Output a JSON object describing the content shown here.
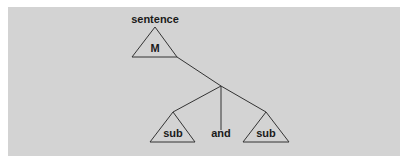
{
  "diagram": {
    "type": "tree",
    "root_label": "sentence",
    "root_node": "M",
    "children": [
      {
        "label": "sub",
        "kind": "subtree"
      },
      {
        "label": "and",
        "kind": "conjunction"
      },
      {
        "label": "sub",
        "kind": "subtree"
      }
    ],
    "colors": {
      "background": "#d3d3d3",
      "line": "#333333",
      "text": "#1a1a1a"
    }
  }
}
